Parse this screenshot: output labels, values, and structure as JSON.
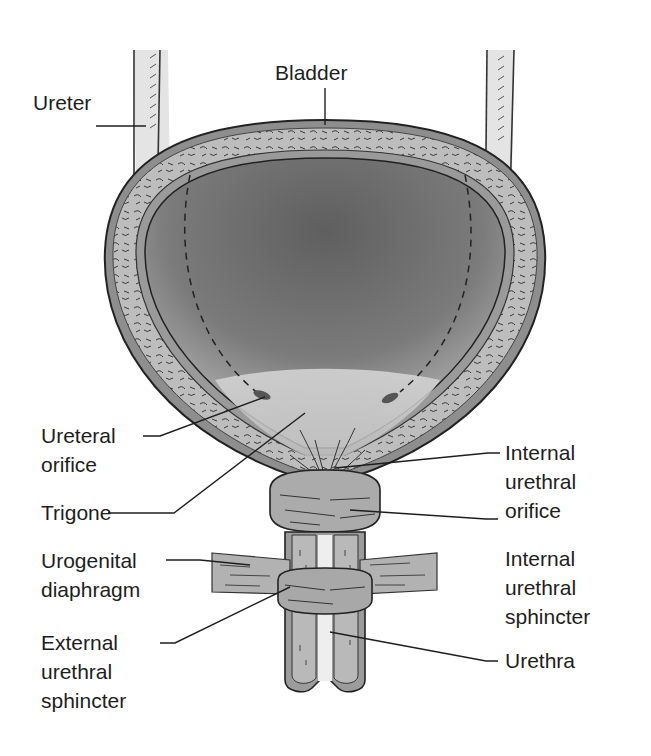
{
  "diagram": {
    "colors": {
      "background": "#ffffff",
      "wall_outer": "#8f8f8f",
      "wall_muscle": "#b8b8b8",
      "lumen_dark": "#6e6e6e",
      "lumen_light": "#cfcfcf",
      "ureter_fill": "#e2e2e2",
      "sphincter_fill": "#a9a9a9",
      "line": "#222222",
      "text": "#1e1e1e"
    },
    "labels": {
      "bladder": "Bladder",
      "ureter": "Ureter",
      "ureteral_orifice": [
        "Ureteral",
        "orifice"
      ],
      "trigone": "Trigone",
      "urogenital_diaphragm": [
        "Urogenital",
        "diaphragm"
      ],
      "external_urethral_sphincter": [
        "External",
        "urethral",
        "sphincter"
      ],
      "internal_urethral_orifice": [
        "Internal",
        "urethral",
        "orifice"
      ],
      "internal_urethral_sphincter": [
        "Internal",
        "urethral",
        "sphincter"
      ],
      "urethra": "Urethra"
    }
  }
}
